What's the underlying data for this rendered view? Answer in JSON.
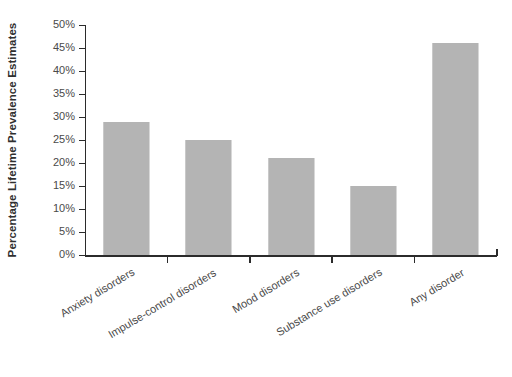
{
  "chart_data": {
    "type": "bar",
    "title": "",
    "subtitle": "",
    "xlabel": "",
    "ylabel": "Percentage Lifetime Prevalence Estimates",
    "categories": [
      "Anxiety disorders",
      "Impulse-control disorders",
      "Mood disorders",
      "Substance use disorders",
      "Any disorder"
    ],
    "values": [
      29,
      25,
      21,
      15,
      46
    ],
    "value_labels": [
      "29%",
      "25%",
      "21%",
      "15%",
      "46%"
    ],
    "ylim": [
      0,
      50
    ],
    "ytick_values": [
      0,
      5,
      10,
      15,
      20,
      25,
      30,
      35,
      40,
      45,
      50
    ],
    "ytick_labels": [
      "0%",
      "5%",
      "10%",
      "15%",
      "20%",
      "25%",
      "30%",
      "35%",
      "40%",
      "45%",
      "50%"
    ],
    "grid": false,
    "legend": false,
    "legend_position": "none",
    "bar_color": "#b4b4b4",
    "axis_color": "#2b2b2b",
    "background_color": "#ffffff",
    "tick_label_color": "#4a4a4a",
    "axis_title_color": "#2f2f2f",
    "x_tick_label_rotation_degrees": -31
  }
}
